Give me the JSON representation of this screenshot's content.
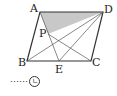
{
  "diagram": {
    "type": "parallelogram",
    "points": {
      "A": {
        "label": "A",
        "x": 40,
        "y": 12
      },
      "D": {
        "label": "D",
        "x": 103,
        "y": 12
      },
      "B": {
        "label": "B",
        "x": 27,
        "y": 61
      },
      "C": {
        "label": "C",
        "x": 91,
        "y": 61
      },
      "E": {
        "label": "E",
        "x": 59,
        "y": 61
      },
      "P": {
        "label": "P",
        "x": 48,
        "y": 34
      }
    },
    "shaded_region": "triangle APD",
    "shade_color": "#c8c8c8",
    "line_color": "#333333",
    "segments": [
      "AB",
      "BC",
      "CD",
      "DA",
      "BD",
      "AE",
      "PC",
      "ED"
    ]
  },
  "legend": {
    "dots": "⋯⋯",
    "marker": "ㄴ"
  }
}
